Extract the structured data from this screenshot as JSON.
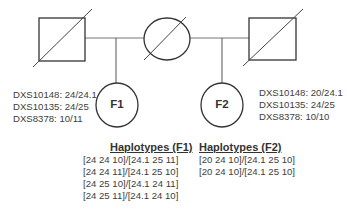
{
  "pedigree": {
    "father_left": {
      "sex": "male",
      "status": "deceased"
    },
    "mother": {
      "sex": "female",
      "status": "deceased"
    },
    "father_right": {
      "sex": "male",
      "status": "deceased"
    },
    "children": [
      {
        "label": "F1",
        "sex": "female"
      },
      {
        "label": "F2",
        "sex": "female"
      }
    ]
  },
  "f1_markers": [
    "DXS10148: 24/24.1",
    "DXS10135: 24/25",
    "DXS8378: 10/11"
  ],
  "f2_markers": [
    "DXS10148: 20/24.1",
    "DXS10135: 24/25",
    "DXS8378: 10/10"
  ],
  "haplotypes_f1": {
    "title": "Haplotypes (F1)",
    "rows": [
      "[24 24 10]/[24.1 25 11]",
      "[24 24 11]/[24.1 25 10]",
      "[24 25 10]/[24.1 24 11]",
      "[24 25 11]/[24.1 24 10]"
    ]
  },
  "haplotypes_f2": {
    "title": "Haplotypes (F2)",
    "rows": [
      "[20 24 10]/[24.1 25 10]",
      "[20 24 10]/[24.1 25 10]"
    ]
  },
  "colors": {
    "line": "#3a3a3a",
    "background": "#ffffff"
  }
}
